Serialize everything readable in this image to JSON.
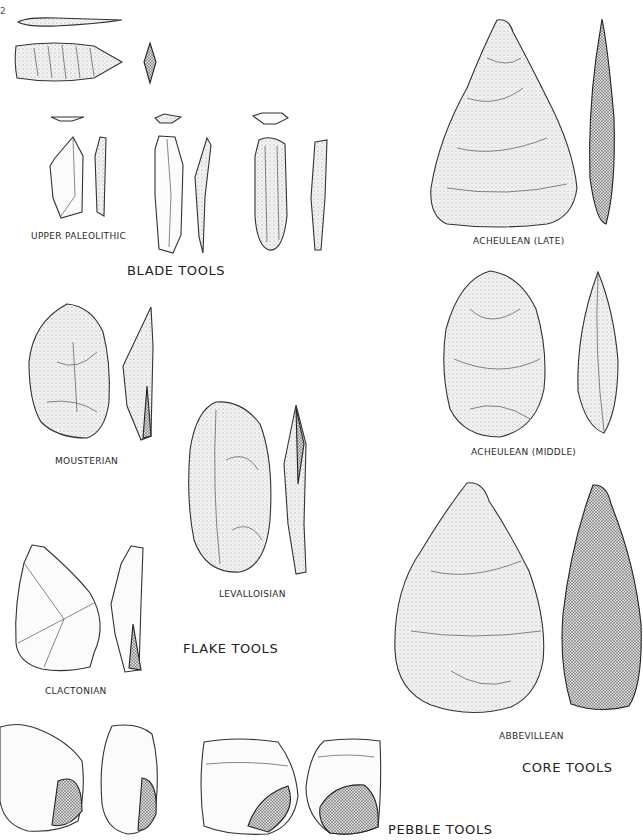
{
  "page": {
    "page_number": "2"
  },
  "groups": {
    "blade_tools": {
      "title": "BLADE TOOLS"
    },
    "flake_tools": {
      "title": "FLAKE TOOLS"
    },
    "core_tools": {
      "title": "CORE TOOLS"
    },
    "pebble_tools": {
      "title": "PEBBLE TOOLS"
    }
  },
  "labels": {
    "upper_paleolithic": "UPPER PALEOLITHIC",
    "acheulean_late": "ACHEULEAN  (LATE)",
    "acheulean_middle": "ACHEULEAN  (MIDDLE)",
    "mousterian": "MOUSTERIAN",
    "levalloisian": "LEVALLOISIAN",
    "clactonian": "CLACTONIAN",
    "abbevillean": "ABBEVILLEAN"
  },
  "icons": {
    "laurel_leaf_point_side": "stone-blade-side-icon",
    "laurel_leaf_point_face": "stone-blade-face-icon",
    "handaxe": "handaxe-icon",
    "flake": "flake-icon",
    "pebble": "pebble-tool-icon"
  }
}
